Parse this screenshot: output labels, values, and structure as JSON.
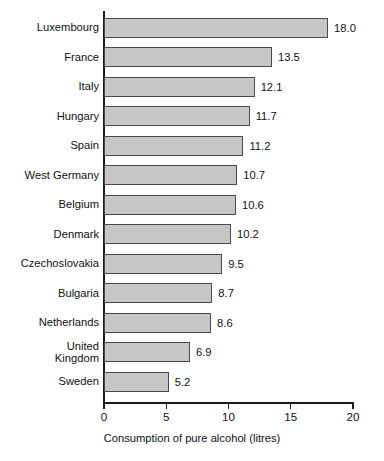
{
  "chart_data": {
    "type": "bar",
    "orientation": "horizontal",
    "title": "",
    "xlabel": "Consumption of pure alcohol (litres)",
    "ylabel": "",
    "xlim": [
      0,
      20
    ],
    "xticks": [
      0,
      5,
      10,
      15,
      20
    ],
    "xtick_labels": [
      "0",
      "5",
      "10",
      "15",
      "20"
    ],
    "grid": false,
    "legend": false,
    "bar_color": "#c6c6c6",
    "bar_border_color": "#4a4a4a",
    "axis_color": "#1a1a1a",
    "background": "#ffffff",
    "categories": [
      "Luxembourg",
      "France",
      "Italy",
      "Hungary",
      "Spain",
      "West Germany",
      "Belgium",
      "Denmark",
      "Czechoslovakia",
      "Bulgaria",
      "Netherlands",
      "United\nKingdom",
      "Sweden"
    ],
    "values": [
      18.0,
      13.5,
      12.1,
      11.7,
      11.2,
      10.7,
      10.6,
      10.2,
      9.5,
      8.7,
      8.6,
      6.9,
      5.2
    ],
    "value_labels": [
      "18.0",
      "13.5",
      "12.1",
      "11.7",
      "11.2",
      "10.7",
      "10.6",
      "10.2",
      "9.5",
      "8.7",
      "8.6",
      "6.9",
      "5.2"
    ]
  }
}
